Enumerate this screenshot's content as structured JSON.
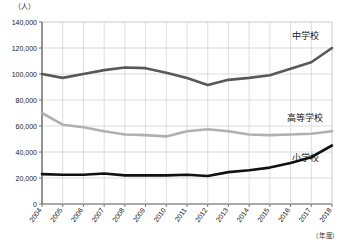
{
  "chart_data": {
    "type": "line",
    "title": "",
    "unit_y": "（人）",
    "unit_x": "（年度）",
    "xlabel": "",
    "ylabel": "",
    "ylim": [
      0,
      140000
    ],
    "ytick_step": 20000,
    "ytick_labels": [
      "140,000",
      "120,000",
      "100,000",
      "80,000",
      "60,000",
      "40,000",
      "20,000",
      "0"
    ],
    "ytick_values": [
      140000,
      120000,
      100000,
      80000,
      60000,
      40000,
      20000,
      0
    ],
    "grid": true,
    "legend_position": "inline-right",
    "categories": [
      "2004",
      "2005",
      "2006",
      "2007",
      "2008",
      "2009",
      "2010",
      "2011",
      "2012",
      "2013",
      "2014",
      "2015",
      "2016",
      "2017",
      "2018"
    ],
    "series": [
      {
        "name": "中学校",
        "color": "#585858",
        "label_x": 2017,
        "label_y": 127000,
        "values": [
          100000,
          97000,
          100000,
          103000,
          105000,
          104500,
          101000,
          97000,
          91500,
          95500,
          97000,
          99000,
          104000,
          109000,
          120000
        ]
      },
      {
        "name": "高等学校",
        "color": "#b0b0b0",
        "label_x": 2017,
        "label_y": 64000,
        "values": [
          70000,
          61000,
          59000,
          56000,
          53500,
          53000,
          52000,
          56000,
          57500,
          56000,
          53500,
          53000,
          53500,
          54000,
          56000
        ]
      },
      {
        "name": "小学校",
        "color": "#111111",
        "label_x": 2017,
        "label_y": 33000,
        "values": [
          23000,
          22500,
          22500,
          23500,
          22000,
          22000,
          22000,
          22500,
          21500,
          24500,
          26000,
          28000,
          31500,
          36000,
          45000
        ]
      }
    ]
  }
}
